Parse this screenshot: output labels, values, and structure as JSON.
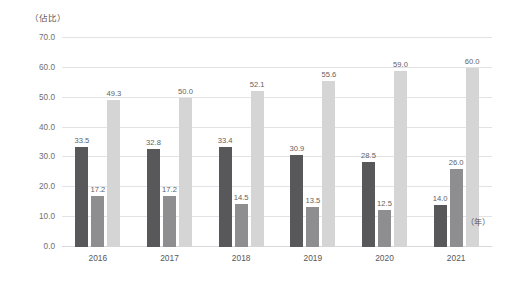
{
  "chart_data": {
    "type": "bar",
    "title": "",
    "subtitle": "",
    "xlabel": "（年）",
    "ylabel": "（佔比）",
    "ylim": [
      0,
      70
    ],
    "ytick_step": 10,
    "ytick_labels": [
      "70.0",
      "60.0",
      "50.0",
      "40.0",
      "30.0",
      "20.0",
      "10.0",
      "0.0"
    ],
    "ytick_values": [
      70,
      60,
      50,
      40,
      30,
      20,
      10,
      0
    ],
    "grid": true,
    "legend": "none",
    "categories": [
      "2016",
      "2017",
      "2018",
      "2019",
      "2020",
      "2021"
    ],
    "series": [
      {
        "name": "series-1",
        "color": "#58585a",
        "values": [
          33.5,
          32.8,
          33.4,
          30.9,
          28.5,
          14.0
        ],
        "labels": [
          "33.5",
          "32.8",
          "33.4",
          "30.9",
          "28.5",
          "14.0"
        ]
      },
      {
        "name": "series-2",
        "color": "#8e8e90",
        "values": [
          17.2,
          17.2,
          14.5,
          13.5,
          12.5,
          26.0
        ],
        "labels": [
          "17.2",
          "17.2",
          "14.5",
          "13.5",
          "12.5",
          "26.0"
        ]
      },
      {
        "name": "series-3",
        "color": "#d5d5d5",
        "values": [
          49.3,
          50.0,
          52.1,
          55.6,
          59.0,
          60.0
        ],
        "labels": [
          "49.3",
          "50.0",
          "52.1",
          "55.6",
          "59.0",
          "60.0"
        ]
      }
    ]
  },
  "colors": {
    "background": "#ffffff",
    "gridline": "#e3e3e5",
    "text": "#58585a",
    "label_text": "#5f5f63"
  }
}
